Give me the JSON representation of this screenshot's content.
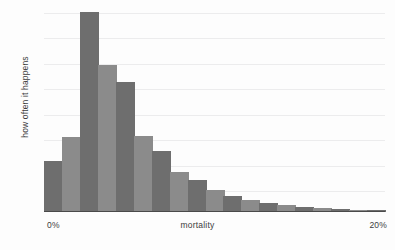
{
  "chart_data": {
    "type": "bar",
    "title": "",
    "subtitle": "",
    "xlabel": "mortality",
    "ylabel": "how often it happens",
    "xlim": [
      0,
      20
    ],
    "ylim": [
      0,
      1.0
    ],
    "x_tick_labels": [
      "0%",
      "20%"
    ],
    "y_tick_labels": [],
    "grid": true,
    "gridline_count": 8,
    "legend": null,
    "legend_position": "none",
    "annotations": [],
    "bar_count": 19,
    "categories": [
      "0-1%",
      "1-2%",
      "2-3%",
      "3-4%",
      "4-5%",
      "5-6%",
      "6-7%",
      "7-8%",
      "8-9%",
      "9-10%",
      "10-11%",
      "11-12%",
      "12-13%",
      "13-14%",
      "14-15%",
      "15-16%",
      "16-17%",
      "17-18%",
      "18-20%"
    ],
    "values": [
      0.255,
      0.375,
      1.0,
      0.735,
      0.65,
      0.38,
      0.305,
      0.2,
      0.16,
      0.11,
      0.08,
      0.06,
      0.046,
      0.035,
      0.026,
      0.02,
      0.015,
      0.011,
      0.008
    ],
    "bar_colors": [
      "#6e6e6e",
      "#8b8b8b",
      "#6e6e6e",
      "#8b8b8b",
      "#6e6e6e",
      "#8b8b8b",
      "#6e6e6e",
      "#8b8b8b",
      "#6e6e6e",
      "#8b8b8b",
      "#6e6e6e",
      "#8b8b8b",
      "#6e6e6e",
      "#8b8b8b",
      "#6e6e6e",
      "#8b8b8b",
      "#6e6e6e",
      "#8b8b8b",
      "#6e6e6e"
    ]
  },
  "axes": {
    "y_title": "how often it happens",
    "x_title": "mortality",
    "x_min_label": "0%",
    "x_max_label": "20%"
  },
  "colors": {
    "bar_dark": "#6e6e6e",
    "bar_light": "#8b8b8b",
    "gridline": "#ececed",
    "axis_line": "#4a4a4a",
    "background": "#fdfdfd",
    "text": "#3c3c3c"
  }
}
